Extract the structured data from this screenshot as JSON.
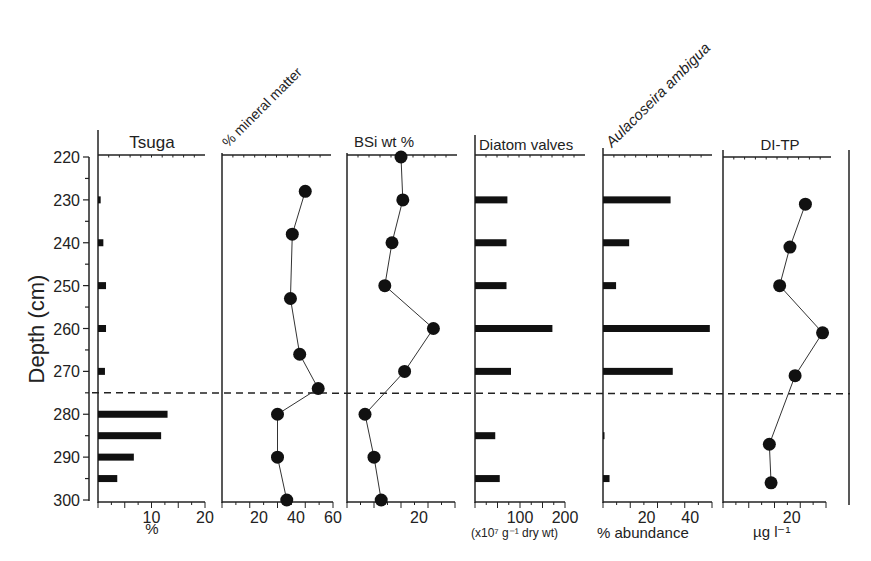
{
  "chart_data": {
    "type": "stratigraphic-profile",
    "y_axis": {
      "label": "Depth (cm)",
      "ticks": [
        220,
        230,
        240,
        250,
        260,
        270,
        280,
        290,
        300
      ],
      "range": [
        220,
        300
      ],
      "inverted": true
    },
    "reference_line": {
      "depth": 275,
      "style": "dashed"
    },
    "panels": [
      {
        "id": "tsuga",
        "title": "Tsuga",
        "title_rotated": false,
        "type": "bar",
        "xlabel": "%",
        "xticks": [
          10,
          20
        ],
        "xlim": [
          0,
          20
        ],
        "depths": [
          230,
          240,
          250,
          260,
          270,
          280,
          285,
          290,
          295
        ],
        "values": [
          0.5,
          1.0,
          1.5,
          1.5,
          1.3,
          13,
          11.8,
          6.7,
          3.6
        ]
      },
      {
        "id": "mineral",
        "title": "% mineral matter",
        "title_rotated": true,
        "type": "line",
        "xlabel": "",
        "xticks": [
          20,
          40,
          60
        ],
        "xlim": [
          0,
          60
        ],
        "depths": [
          228,
          238,
          253,
          266,
          274,
          280,
          290,
          300
        ],
        "values": [
          45,
          38,
          37,
          42,
          52,
          30,
          30,
          35
        ]
      },
      {
        "id": "bsi",
        "title": "BSi wt %",
        "title_rotated": false,
        "type": "line",
        "xlabel": "",
        "xticks": [
          20
        ],
        "xlim": [
          0,
          30
        ],
        "depths": [
          220,
          230,
          240,
          250,
          260,
          270,
          280,
          290,
          300
        ],
        "values": [
          15,
          15.5,
          12.5,
          10.5,
          24,
          16,
          5,
          7.5,
          9.5
        ]
      },
      {
        "id": "diatom",
        "title": "Diatom valves",
        "title_rotated": false,
        "type": "bar",
        "xlabel": "(x10⁷ g⁻¹ dry wt)",
        "xticks": [
          100,
          200
        ],
        "xlim": [
          0,
          200
        ],
        "depths": [
          230,
          240,
          250,
          260,
          270,
          285,
          295
        ],
        "values": [
          72,
          70,
          70,
          172,
          80,
          45,
          55
        ]
      },
      {
        "id": "aulacoseira",
        "title": "Aulacoseira ambigua",
        "title_rotated": true,
        "type": "bar",
        "xlabel": "% abundance",
        "xticks": [
          20,
          40
        ],
        "xlim": [
          0,
          50
        ],
        "depths": [
          230,
          240,
          250,
          260,
          270,
          285,
          295
        ],
        "values": [
          31,
          12,
          6,
          49,
          32,
          0.5,
          3
        ]
      },
      {
        "id": "ditp",
        "title": "DI-TP",
        "title_rotated": false,
        "type": "line",
        "xlabel": "µg l⁻¹",
        "xticks": [
          20
        ],
        "xlim": [
          0,
          30
        ],
        "depths": [
          231,
          241,
          250,
          261,
          271,
          287,
          296
        ],
        "values": [
          24,
          19.5,
          16.5,
          29,
          21,
          13.5,
          14
        ]
      }
    ]
  }
}
